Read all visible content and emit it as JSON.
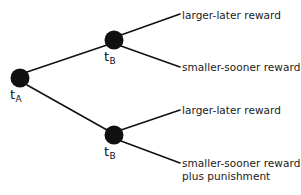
{
  "figure": {
    "type": "decision-tree-diagram",
    "background_color": "#ffffff",
    "line_color": "#111111",
    "node_color": "#111111",
    "text_color": "#1a1a1a"
  },
  "nodes": [
    {
      "id": "root",
      "label_text": "t",
      "label_sub": "A",
      "cx": 20,
      "cy": 78,
      "r": 9.5,
      "label_x": 10,
      "label_y": 88
    },
    {
      "id": "upper-tb",
      "label_text": "t",
      "label_sub": "B",
      "cx": 114,
      "cy": 40,
      "r": 9.5,
      "label_x": 104,
      "label_y": 50
    },
    {
      "id": "lower-tb",
      "label_text": "t",
      "label_sub": "B",
      "cx": 114,
      "cy": 135,
      "r": 9.5,
      "label_x": 104,
      "label_y": 145
    }
  ],
  "edges": [
    {
      "id": "root-to-upper",
      "x1": 27,
      "y1": 72,
      "x2": 107,
      "y2": 45
    },
    {
      "id": "root-to-lower",
      "x1": 27,
      "y1": 85,
      "x2": 107,
      "y2": 130
    },
    {
      "id": "upper-to-leaf1",
      "x1": 121,
      "y1": 35,
      "x2": 180,
      "y2": 14
    },
    {
      "id": "upper-to-leaf2",
      "x1": 121,
      "y1": 46,
      "x2": 180,
      "y2": 67
    },
    {
      "id": "lower-to-leaf3",
      "x1": 121,
      "y1": 130,
      "x2": 180,
      "y2": 110
    },
    {
      "id": "lower-to-leaf4",
      "x1": 121,
      "y1": 141,
      "x2": 180,
      "y2": 163
    }
  ],
  "leaves": [
    {
      "id": "leaf-larger-later-top",
      "text": "larger-later reward",
      "x": 182,
      "y": 9
    },
    {
      "id": "leaf-smaller-sooner-top",
      "text": "smaller-sooner reward",
      "x": 182,
      "y": 61
    },
    {
      "id": "leaf-larger-later-bottom",
      "text": "larger-later reward",
      "x": 182,
      "y": 104
    },
    {
      "id": "leaf-smaller-sooner-punishment",
      "text": "smaller-sooner reward\nplus punishment",
      "x": 182,
      "y": 157
    }
  ]
}
